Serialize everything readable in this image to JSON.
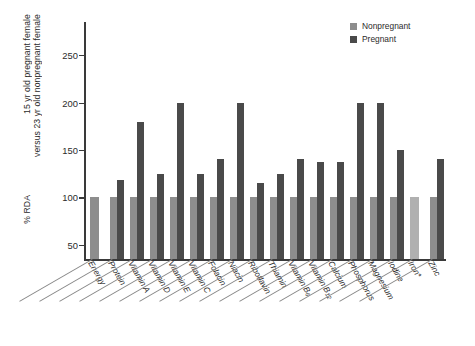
{
  "chart_data": {
    "type": "bar",
    "title": "",
    "subtitle": "",
    "xlabel": "",
    "ylabel_lines": [
      "15 yr old pregnant female",
      "versus 23 yr old nonpregnant female"
    ],
    "ylabel_unit": "% RDA",
    "ylim": [
      35,
      285
    ],
    "yticks": [
      50,
      100,
      150,
      200,
      250
    ],
    "ytick_labels": [
      "50",
      "100",
      "150",
      "200",
      "250"
    ],
    "grid": false,
    "legend_position": "top-right",
    "categories": [
      "Energy",
      "Protein",
      "Vitamin A",
      "Vitamin D",
      "Vitamin E",
      "Vitamin C",
      "Folacin",
      "Niacin",
      "Riboflavin",
      "Thiamin",
      "Vitamin B6",
      "Vitamin B12",
      "Calcium",
      "Phosphorus",
      "Magnesium",
      "Iodine",
      "Iron*",
      "Zinc"
    ],
    "category_labels_html": [
      "Energy",
      "Protein",
      "Vitamin A",
      "Vitamin D",
      "Vitamin E",
      "Vitamin C",
      "Folacin",
      "Niacin",
      "Riboflavin",
      "Thiamin",
      "Vitamin B<span class='sub'>6</span>",
      "Vitamin B<span class='sub'>12</span>",
      "Calcium",
      "Phosphorus",
      "Magnesium",
      "Iodine",
      "Iron*",
      "Zinc"
    ],
    "series": [
      {
        "name": "Nonpregnant",
        "color": "#8d8d8d",
        "values": [
          100,
          100,
          100,
          100,
          100,
          100,
          100,
          100,
          100,
          100,
          100,
          100,
          100,
          100,
          100,
          100,
          100,
          100
        ]
      },
      {
        "name": "Pregnant",
        "color": "#4a4a4a",
        "values": [
          null,
          118,
          180,
          125,
          200,
          125,
          140,
          200,
          115,
          125,
          140,
          137,
          137,
          200,
          200,
          150,
          null,
          140
        ]
      }
    ]
  },
  "legend": {
    "items": [
      {
        "label": "Nonpregnant",
        "color": "#8d8d8d"
      },
      {
        "label": "Pregnant",
        "color": "#4a4a4a"
      }
    ]
  }
}
